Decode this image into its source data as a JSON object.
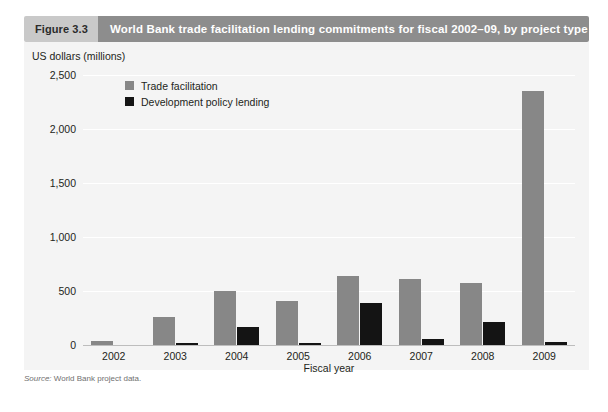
{
  "figure": {
    "number_label": "Figure 3.3",
    "title": "World Bank trade facilitation lending commitments for fiscal 2002–09, by project type",
    "source_prefix": "Source:",
    "source_text": "World Bank project data."
  },
  "colors": {
    "header_number_bg": "#c9c9c9",
    "header_title_bg": "#8d8d8d",
    "header_title_text": "#ffffff",
    "panel_bg": "#f4f4f4",
    "gridline": "#ffffff",
    "baseline": "#bdbdbd",
    "series_trade_facilitation": "#878787",
    "series_development_policy": "#141414",
    "text": "#231f20",
    "source_text": "#6f6f6f"
  },
  "chart_data": {
    "type": "bar",
    "title": "World Bank trade facilitation lending commitments for fiscal 2002–09, by project type",
    "subtitle": "",
    "xlabel": "Fiscal year",
    "ylabel": "US dollars (millions)",
    "categories": [
      "2002",
      "2003",
      "2004",
      "2005",
      "2006",
      "2007",
      "2008",
      "2009"
    ],
    "series": [
      {
        "name": "Trade facilitation",
        "color": "#878787",
        "values": [
          35,
          260,
          500,
          410,
          640,
          610,
          570,
          2350
        ]
      },
      {
        "name": "Development policy lending",
        "color": "#141414",
        "values": [
          0,
          15,
          165,
          20,
          390,
          55,
          215,
          25
        ]
      }
    ],
    "ylim": [
      0,
      2500
    ],
    "yticks": [
      0,
      500,
      1000,
      1500,
      2000,
      2500
    ],
    "ytick_labels": [
      "0",
      "500",
      "1,000",
      "1,500",
      "2,000",
      "2,500"
    ],
    "grid": true,
    "legend_position": "top-left-inside"
  }
}
